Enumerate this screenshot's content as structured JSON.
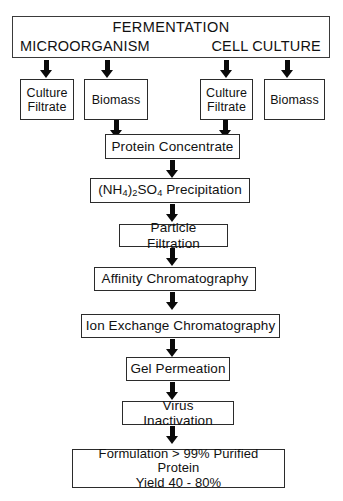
{
  "diagram": {
    "header": {
      "title": "FERMENTATION",
      "left_label": "MICROORGANISM",
      "right_label": "CELL CULTURE"
    },
    "source_boxes": [
      {
        "id": "micro-culture-filtrate",
        "line1": "Culture",
        "line2": "Filtrate"
      },
      {
        "id": "micro-biomass",
        "line1": "Biomass",
        "line2": ""
      },
      {
        "id": "cell-culture-filtrate",
        "line1": "Culture",
        "line2": "Filtrate"
      },
      {
        "id": "cell-biomass",
        "line1": "Biomass",
        "line2": ""
      }
    ],
    "steps": [
      {
        "id": "protein-concentrate",
        "label": "Protein Concentrate"
      },
      {
        "id": "ammonium-sulfate-precipitation",
        "label": "(NH4)2SO4 Precipitation",
        "formula_prefix": "(NH",
        "sub1": "4",
        "mid": ")",
        "sub2": "2",
        "mid2": "SO",
        "sub3": "4",
        "suffix": " Precipitation"
      },
      {
        "id": "particle-filtration",
        "label": "Particle Filtration"
      },
      {
        "id": "affinity-chromatography",
        "label": "Affinity Chromatography"
      },
      {
        "id": "ion-exchange-chromatography",
        "label": "Ion Exchange Chromatography"
      },
      {
        "id": "gel-permeation",
        "label": "Gel Permeation"
      },
      {
        "id": "virus-inactivation",
        "label": "Virus Inactivation"
      }
    ],
    "outcome": {
      "id": "formulation",
      "line1": "Formulation > 99% Purified Protein",
      "line2": "Yield 40 - 80%"
    },
    "colors": {
      "box_border": "#2b2b2b",
      "arrow_fill": "#0a0a0a",
      "text": "#111111",
      "background": "#ffffff"
    }
  }
}
